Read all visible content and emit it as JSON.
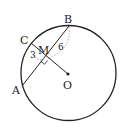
{
  "diagram": {
    "type": "geometry",
    "labels": {
      "A": "A",
      "B": "B",
      "C": "C",
      "M": "M",
      "O": "O"
    },
    "measurements": {
      "CM": "3",
      "MB": "6"
    },
    "colors": {
      "stroke": "#222222",
      "dashed": "#999999"
    }
  }
}
